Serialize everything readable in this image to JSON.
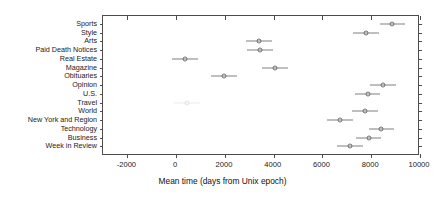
{
  "chart_data": {
    "type": "scatter",
    "title": "",
    "xlabel": "Mean time (days from Unix epoch)",
    "ylabel": "",
    "xlim": [
      -3000,
      10000
    ],
    "xticks": [
      -2000,
      0,
      2000,
      4000,
      6000,
      8000,
      10000
    ],
    "xtick_labels": [
      "-2000",
      "0",
      "2000",
      "4000",
      "6000",
      "8000",
      "10000"
    ],
    "grid": false,
    "legend": null,
    "orientation": "horizontal",
    "marker_style": "open-circle",
    "error_bar_style": "horizontal-line-no-caps",
    "categories": [
      "Sports",
      "Style",
      "Arts",
      "Paid Death Notices",
      "Real Estate",
      "Magazine",
      "Obituaries",
      "Opinion",
      "U.S.",
      "Travel",
      "World",
      "New York and Region",
      "Technology",
      "Business",
      "Week in Review"
    ],
    "values": [
      8870,
      7770,
      3400,
      3430,
      380,
      4040,
      1960,
      8490,
      7850,
      450,
      7740,
      6720,
      8420,
      7890,
      7130
    ],
    "err_low": [
      8340,
      7240,
      2870,
      2900,
      -150,
      3510,
      1430,
      7960,
      7320,
      -80,
      7210,
      6190,
      7890,
      7360,
      6600
    ],
    "err_high": [
      9400,
      8300,
      3930,
      3960,
      910,
      4570,
      2490,
      9020,
      8380,
      980,
      8270,
      7250,
      8950,
      8420,
      7660
    ],
    "points": [
      {
        "category": "Sports",
        "value": 8870,
        "err_low": 8340,
        "err_high": 9400,
        "faint": false
      },
      {
        "category": "Style",
        "value": 7770,
        "err_low": 7240,
        "err_high": 8300,
        "faint": false
      },
      {
        "category": "Arts",
        "value": 3400,
        "err_low": 2870,
        "err_high": 3930,
        "faint": false
      },
      {
        "category": "Paid Death Notices",
        "value": 3430,
        "err_low": 2900,
        "err_high": 3960,
        "faint": false
      },
      {
        "category": "Real Estate",
        "value": 380,
        "err_low": -150,
        "err_high": 910,
        "faint": false
      },
      {
        "category": "Magazine",
        "value": 4040,
        "err_low": 3510,
        "err_high": 4570,
        "faint": false
      },
      {
        "category": "Obituaries",
        "value": 1960,
        "err_low": 1430,
        "err_high": 2490,
        "faint": false
      },
      {
        "category": "Opinion",
        "value": 8490,
        "err_low": 7960,
        "err_high": 9020,
        "faint": false
      },
      {
        "category": "U.S.",
        "value": 7850,
        "err_low": 7320,
        "err_high": 8380,
        "faint": false
      },
      {
        "category": "Travel",
        "value": 450,
        "err_low": -80,
        "err_high": 980,
        "faint": true
      },
      {
        "category": "World",
        "value": 7740,
        "err_low": 7210,
        "err_high": 8270,
        "faint": false
      },
      {
        "category": "New York and Region",
        "value": 6720,
        "err_low": 6190,
        "err_high": 7250,
        "faint": false
      },
      {
        "category": "Technology",
        "value": 8420,
        "err_low": 7890,
        "err_high": 8950,
        "faint": false
      },
      {
        "category": "Business",
        "value": 7890,
        "err_low": 7360,
        "err_high": 8420,
        "faint": false
      },
      {
        "category": "Week in Review",
        "value": 7130,
        "err_low": 6600,
        "err_high": 7660,
        "faint": false
      }
    ],
    "colors": {
      "marker": "#6e6e6e",
      "error_bar": "#808080",
      "axis": "#4d4d4d",
      "text": "#1a1a1a",
      "background": "#ffffff",
      "faint_marker": "#e2e2e2"
    }
  }
}
